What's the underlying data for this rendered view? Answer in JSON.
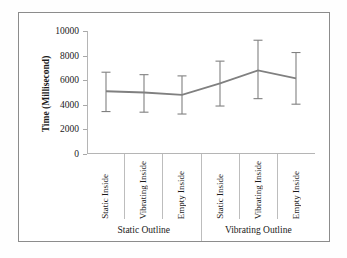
{
  "chart_data": {
    "type": "line",
    "title": "",
    "subtitle": "",
    "xlabel": "",
    "ylabel": "Time (Millisecond)",
    "ylim": [
      0,
      10000
    ],
    "ytick_labels": [
      "0",
      "2000",
      "4000",
      "6000",
      "8000",
      "10000"
    ],
    "ytick_values": [
      0,
      2000,
      4000,
      6000,
      8000,
      10000
    ],
    "grid": false,
    "legend": "none",
    "line_color": "#808080",
    "error_bar_color": "#808080",
    "categories": [
      "Static Inside",
      "Vibrating Inside",
      "Empty Inside",
      "Static Inside",
      "Vibrating Inside",
      "Empty Inside"
    ],
    "groups": [
      {
        "label": "Static Outline",
        "span": 3
      },
      {
        "label": "Vibrating Outline",
        "span": 3
      }
    ],
    "series": [
      {
        "name": "Time",
        "values": [
          5100,
          5000,
          4800,
          5750,
          6800,
          6150
        ],
        "error_lower": [
          3450,
          3400,
          3250,
          3900,
          4500,
          4050
        ],
        "error_upper": [
          6650,
          6450,
          6350,
          7550,
          9250,
          8250
        ]
      }
    ]
  },
  "axis": {
    "y_title": "Time (Millisecond)"
  }
}
